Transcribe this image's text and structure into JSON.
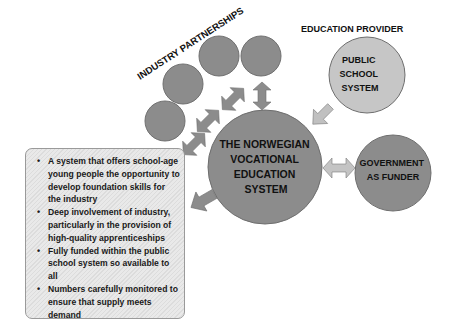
{
  "diagram": {
    "labels": {
      "industry": "INDUSTRY PARTNERSHIPS",
      "education_provider": "EDUCATION PROVIDER"
    },
    "nodes": {
      "main": [
        "THE NORWEGIAN",
        "VOCATIONAL",
        "EDUCATION",
        "SYSTEM"
      ],
      "public": [
        "PUBLIC",
        "SCHOOL",
        "SYSTEM"
      ],
      "government": [
        "GOVERNMENT",
        "AS FUNDER"
      ]
    },
    "industry_circles": 4,
    "bullets": [
      "A system that offers school-age young people the opportunity to develop foundation skills for the industry",
      "Deep involvement of industry, particularly in the provision of high-quality apprenticeships",
      "Fully funded within the public school system so available to all",
      "Numbers carefully monitored to ensure that supply meets demand"
    ],
    "colors": {
      "dark_circle": "#8c8c8c",
      "light_circle": "#c4c4c4",
      "arrow_dark": "#8c8c8c",
      "arrow_light": "#b8b8b8",
      "outline": "#6e6e6e"
    }
  }
}
